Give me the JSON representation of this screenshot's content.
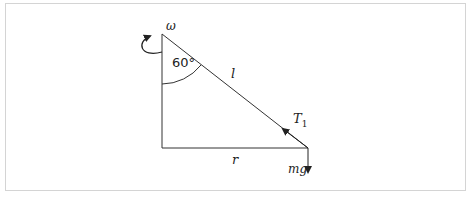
{
  "diagram": {
    "labels": {
      "omega": "ω",
      "angle": "60°",
      "length": "l",
      "tension": "T",
      "tension_sub": "1",
      "radius": "r",
      "weight": "mg"
    },
    "angle_degrees": 60,
    "colors": {
      "line": "#222222",
      "frame": "#d4d4d4"
    }
  }
}
